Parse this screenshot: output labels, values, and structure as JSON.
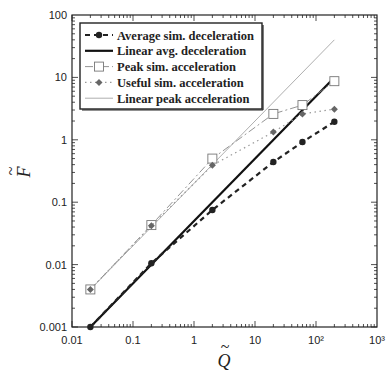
{
  "chart_data": {
    "type": "line",
    "title": "",
    "xlabel": "Q̃",
    "ylabel": "F̃",
    "xscale": "log",
    "yscale": "log",
    "xlim": [
      0.01,
      1000
    ],
    "ylim": [
      0.001,
      100
    ],
    "grid": false,
    "legend_position": "upper left",
    "x_tick_labels": [
      "0.01",
      "0.1",
      "1",
      "10",
      "10²",
      "10³"
    ],
    "x_ticks": [
      0.01,
      0.1,
      1,
      10,
      100,
      1000
    ],
    "y_tick_labels": [
      "0.001",
      "0.01",
      "0.1",
      "1",
      "10",
      "100"
    ],
    "y_ticks": [
      0.001,
      0.01,
      0.1,
      1,
      10,
      100
    ],
    "series": [
      {
        "name": "Average sim. deceleration",
        "style": "dashed",
        "marker": "filled-circle",
        "color": "#222222",
        "x": [
          0.02,
          0.2,
          2,
          20,
          60,
          200
        ],
        "values": [
          0.001,
          0.0105,
          0.075,
          0.44,
          0.92,
          1.95
        ]
      },
      {
        "name": "Linear avg. deceleration",
        "style": "solid-thick",
        "marker": "none",
        "color": "#111111",
        "x": [
          0.02,
          200
        ],
        "values": [
          0.001,
          10
        ]
      },
      {
        "name": "Peak sim. acceleration",
        "style": "dash-dot",
        "marker": "open-square",
        "color": "#888888",
        "x": [
          0.02,
          0.2,
          2,
          20,
          60,
          200
        ],
        "values": [
          0.004,
          0.043,
          0.5,
          2.6,
          3.6,
          8.7
        ]
      },
      {
        "name": "Useful sim. acceleration",
        "style": "dotted",
        "marker": "filled-diamond",
        "color": "#999999",
        "x": [
          0.02,
          0.2,
          2,
          20,
          60,
          200
        ],
        "values": [
          0.004,
          0.042,
          0.39,
          1.33,
          2.6,
          3.1
        ]
      },
      {
        "name": "Linear peak acceleration",
        "style": "solid-thin",
        "marker": "none",
        "color": "#999999",
        "x": [
          0.02,
          200
        ],
        "values": [
          0.004,
          40
        ]
      }
    ]
  },
  "legend": {
    "items": [
      "Average sim. deceleration",
      "Linear avg. deceleration",
      "Peak sim. acceleration",
      "Useful sim. acceleration",
      "Linear peak acceleration"
    ]
  },
  "axes": {
    "xlabel_base": "Q",
    "ylabel_base": "F",
    "tilde": "~"
  }
}
